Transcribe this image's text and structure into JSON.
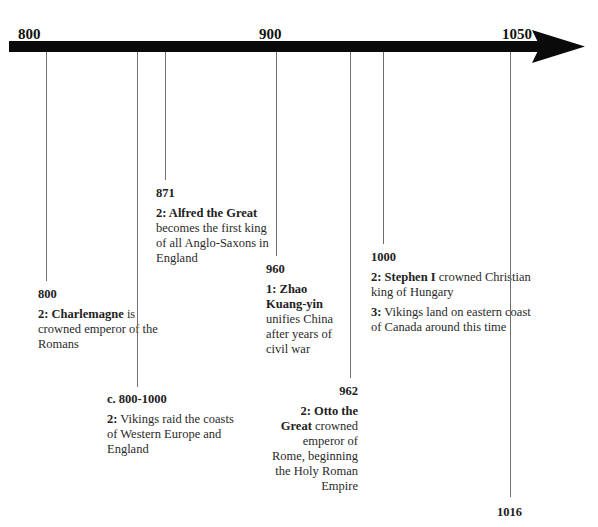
{
  "timeline": {
    "axis": [
      {
        "label": "800",
        "x": 18
      },
      {
        "label": "900",
        "x": 259
      },
      {
        "label": "1050",
        "x": 502
      }
    ],
    "events": [
      {
        "year": "800",
        "line_x": 46,
        "line_top": 52,
        "line_bottom": 281,
        "box": {
          "left": 38,
          "top": 287,
          "width": 130,
          "align": "left"
        },
        "items": [
          {
            "bold": "2: Charlemagne",
            "text": " is crowned emperor of the Romans"
          }
        ]
      },
      {
        "year": "c. 800-1000",
        "line_x": 137,
        "line_top": 52,
        "line_bottom": 387,
        "box": {
          "left": 107,
          "top": 392,
          "width": 130,
          "align": "left"
        },
        "items": [
          {
            "bold": "2:",
            "text": " Vikings raid the coasts of Western Europe and England"
          }
        ]
      },
      {
        "year": "871",
        "line_x": 165,
        "line_top": 52,
        "line_bottom": 180,
        "box": {
          "left": 156,
          "top": 186,
          "width": 120,
          "align": "left"
        },
        "items": [
          {
            "bold": "2: Alfred the Great",
            "text": " becomes the first king of all Anglo-Saxons in England"
          }
        ]
      },
      {
        "year": "960",
        "line_x": 276,
        "line_top": 52,
        "line_bottom": 256,
        "box": {
          "left": 266,
          "top": 262,
          "width": 80,
          "align": "left"
        },
        "items": [
          {
            "bold": "1: Zhao Kuang-yin",
            "text": " unifies China after years of civil war"
          }
        ]
      },
      {
        "year": "962",
        "line_x": 350,
        "line_top": 52,
        "line_bottom": 378,
        "box": {
          "left": 270,
          "top": 384,
          "width": 88,
          "align": "right"
        },
        "items": [
          {
            "bold": "2: Otto the Great",
            "text": " crowned emperor of Rome, beginning the Holy Roman Empire"
          }
        ]
      },
      {
        "year": "1000",
        "line_x": 383,
        "line_top": 52,
        "line_bottom": 244,
        "box": {
          "left": 371,
          "top": 250,
          "width": 170,
          "align": "left"
        },
        "items": [
          {
            "bold": "2: Stephen I",
            "text": " crowned Christian king of Hungary"
          },
          {
            "bold": "3:",
            "text": " Vikings land on eastern coast of Canada around this time"
          }
        ]
      },
      {
        "year": "1016",
        "line_x": 510,
        "line_top": 52,
        "line_bottom": 497,
        "box": {
          "left": 497,
          "top": 505,
          "width": 60,
          "align": "left"
        },
        "items": []
      }
    ]
  }
}
